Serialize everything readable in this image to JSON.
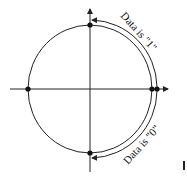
{
  "diagram": {
    "labels": {
      "upper_arc": "Data is \"1\"",
      "lower_arc": "Data is \"0\""
    },
    "colors": {
      "stroke": "#222222",
      "background": "#ffffff"
    },
    "points": [
      {
        "name": "top",
        "x": 90,
        "y": 25
      },
      {
        "name": "left",
        "x": 28,
        "y": 89
      },
      {
        "name": "right-inner",
        "x": 152,
        "y": 89
      },
      {
        "name": "right-outer",
        "x": 157,
        "y": 89
      },
      {
        "name": "bottom",
        "x": 90,
        "y": 153
      }
    ]
  }
}
